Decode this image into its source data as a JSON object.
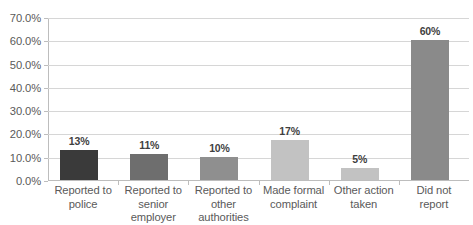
{
  "chart_data": {
    "type": "bar",
    "title": "",
    "subtitle": "",
    "xlabel": "",
    "ylabel": "",
    "grid": true,
    "legend": false,
    "ylim": [
      0,
      70
    ],
    "y_ticks": [
      "0.0%",
      "10.0%",
      "20.0%",
      "30.0%",
      "40.0%",
      "50.0%",
      "60.0%",
      "70.0%"
    ],
    "y_tick_values": [
      0,
      10,
      20,
      30,
      40,
      50,
      60,
      70
    ],
    "categories": [
      "Reported to police",
      "Reported to senior employer",
      "Reported to other authorities",
      "Made formal complaint",
      "Other action taken",
      "Did not report"
    ],
    "category_lines": [
      [
        "Reported to",
        "police"
      ],
      [
        "Reported to",
        "senior",
        "employer"
      ],
      [
        "Reported to",
        "other",
        "authorities"
      ],
      [
        "Made formal",
        "complaint"
      ],
      [
        "Other action",
        "taken"
      ],
      [
        "Did not",
        "report"
      ]
    ],
    "values": [
      13,
      11,
      10,
      17,
      5,
      60
    ],
    "data_labels": [
      "13%",
      "11%",
      "10%",
      "17%",
      "5%",
      "60%"
    ],
    "bar_colors": [
      "#3a3a3a",
      "#6e6e6e",
      "#8f8f8f",
      "#c2c2c2",
      "#c2c2c2",
      "#8a8a8a"
    ]
  }
}
